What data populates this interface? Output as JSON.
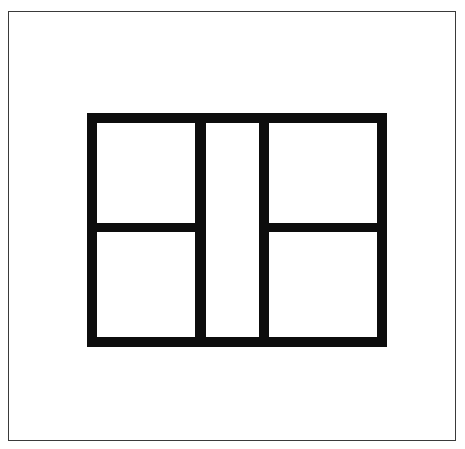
{
  "page": {
    "background_color": "#ffffff",
    "width": 465,
    "height": 449
  },
  "outer_border": {
    "name": "outer-border",
    "color": "#3a3a3a",
    "stroke_width": 1.4,
    "x": 8,
    "y": 11,
    "width": 448,
    "height": 430
  },
  "figure": {
    "name": "partitioned-rectangle",
    "line_color": "#0d0d0d",
    "fill_color": "#ffffff",
    "stroke_width": 10,
    "x": 87,
    "y": 113,
    "width": 300,
    "height": 234,
    "cell_count": 5,
    "column_count": 3,
    "bars": [
      {
        "name": "frame-top",
        "orientation": "horizontal",
        "x": 0,
        "y": 0,
        "width": 300,
        "height": 10
      },
      {
        "name": "frame-bottom",
        "orientation": "horizontal",
        "x": 0,
        "y": 224,
        "width": 300,
        "height": 10
      },
      {
        "name": "frame-left",
        "orientation": "vertical",
        "x": 0,
        "y": 0,
        "width": 10,
        "height": 234
      },
      {
        "name": "frame-right",
        "orientation": "vertical",
        "x": 290,
        "y": 0,
        "width": 10,
        "height": 234
      },
      {
        "name": "divider-vertical-left",
        "orientation": "vertical",
        "x": 108,
        "y": 0,
        "width": 11,
        "height": 234
      },
      {
        "name": "divider-vertical-right",
        "orientation": "vertical",
        "x": 172,
        "y": 0,
        "width": 10,
        "height": 234
      },
      {
        "name": "divider-horizontal-left",
        "orientation": "horizontal",
        "x": 0,
        "y": 110,
        "width": 119,
        "height": 9
      },
      {
        "name": "divider-horizontal-right",
        "orientation": "horizontal",
        "x": 172,
        "y": 110,
        "width": 128,
        "height": 9
      }
    ],
    "cells": [
      {
        "name": "cell-top-left",
        "column": "left",
        "row": "top",
        "x": 10,
        "y": 10,
        "width": 98,
        "height": 100
      },
      {
        "name": "cell-bottom-left",
        "column": "left",
        "row": "bottom",
        "x": 10,
        "y": 119,
        "width": 98,
        "height": 105
      },
      {
        "name": "cell-center",
        "column": "center",
        "row": "full",
        "x": 119,
        "y": 10,
        "width": 53,
        "height": 214
      },
      {
        "name": "cell-top-right",
        "column": "right",
        "row": "top",
        "x": 182,
        "y": 10,
        "width": 108,
        "height": 100
      },
      {
        "name": "cell-bottom-right",
        "column": "right",
        "row": "bottom",
        "x": 182,
        "y": 119,
        "width": 108,
        "height": 105
      }
    ]
  }
}
